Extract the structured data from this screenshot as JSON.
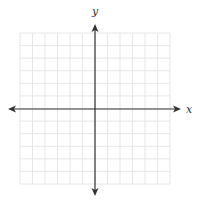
{
  "diagram": {
    "type": "coordinate-plane",
    "x_axis_label": "x",
    "y_axis_label": "y",
    "grid": {
      "columns": 12,
      "rows": 12,
      "left": 20,
      "top": 33,
      "right": 170,
      "bottom": 184,
      "line_color": "#e6e6e6"
    },
    "axes": {
      "origin_x": 95,
      "origin_y": 109,
      "x_arrow_left": 8,
      "x_arrow_right": 181,
      "y_arrow_top": 24,
      "y_arrow_bottom": 196,
      "color": "#333333"
    }
  }
}
